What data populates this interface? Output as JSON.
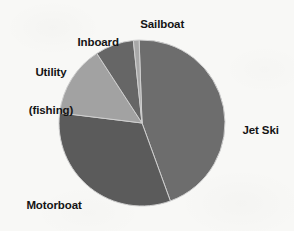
{
  "chart_data": {
    "type": "pie",
    "title": "",
    "subtitle": "",
    "xlabel": "",
    "ylabel": "",
    "legend_position": "none",
    "grid": false,
    "labels_shown_on_slices": false,
    "categories": [
      "Jet Ski",
      "Motorboat",
      "Utility (fishing)",
      "Inboard",
      "Sailboat"
    ],
    "values": [
      44,
      33,
      14,
      7.5,
      1.5
    ],
    "units": "percent",
    "start_angle_deg": 358,
    "direction": "clockwise",
    "slices": [
      {
        "name": "Jet Ski",
        "label": "Jet Ski",
        "value": 44,
        "start_angle_deg": 358,
        "end_angle_deg": 160,
        "color": "#6d6d6d",
        "label_position": "right"
      },
      {
        "name": "Motorboat",
        "label": "Motorboat",
        "value": 33,
        "start_angle_deg": 160,
        "end_angle_deg": 277,
        "color": "#5b5b5b",
        "label_position": "bottom-left"
      },
      {
        "name": "Utility (fishing)",
        "label_line_1": "Utility",
        "label_line_2": "(fishing)",
        "value": 14,
        "start_angle_deg": 277,
        "end_angle_deg": 327,
        "color": "#a2a2a2",
        "label_position": "left"
      },
      {
        "name": "Inboard",
        "label": "Inboard",
        "value": 7.5,
        "start_angle_deg": 327,
        "end_angle_deg": 354,
        "color": "#666666",
        "label_position": "top-left"
      },
      {
        "name": "Sailboat",
        "label": "Sailboat",
        "value": 1.5,
        "start_angle_deg": 354,
        "end_angle_deg": 358,
        "color": "#a8a8a8",
        "label_position": "top"
      }
    ]
  },
  "labels": {
    "sailboat": "Sailboat",
    "inboard": "Inboard",
    "utility_line1": "Utility",
    "utility_line2": "(fishing)",
    "jet_ski": "Jet Ski",
    "motorboat": "Motorboat"
  },
  "colors": {
    "background": "#f8f8f6",
    "text": "#141414",
    "jet_ski": "#6d6d6d",
    "motorboat": "#5b5b5b",
    "utility": "#a2a2a2",
    "inboard": "#666666",
    "sailboat": "#a8a8a8",
    "slice_divider": "#cfcfcf"
  },
  "geometry": {
    "center_x": 142,
    "center_y": 123,
    "radius": 83
  }
}
